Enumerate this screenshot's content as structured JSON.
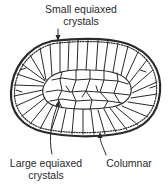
{
  "figure": {
    "labels": {
      "small_equiaxed": [
        "Small equiaxed",
        "crystals"
      ],
      "large_equiaxed": [
        "Large equiaxed",
        "crystals"
      ],
      "columnar": "Columnar"
    },
    "zones": [
      {
        "name": "Small equiaxed crystals",
        "location": "outer chill zone at mold wall"
      },
      {
        "name": "Columnar",
        "location": "grains growing inward from wall"
      },
      {
        "name": "Large equiaxed crystals",
        "location": "central region"
      }
    ],
    "colors": {
      "line": "#2a2a2a",
      "background": "#ffffff"
    }
  }
}
